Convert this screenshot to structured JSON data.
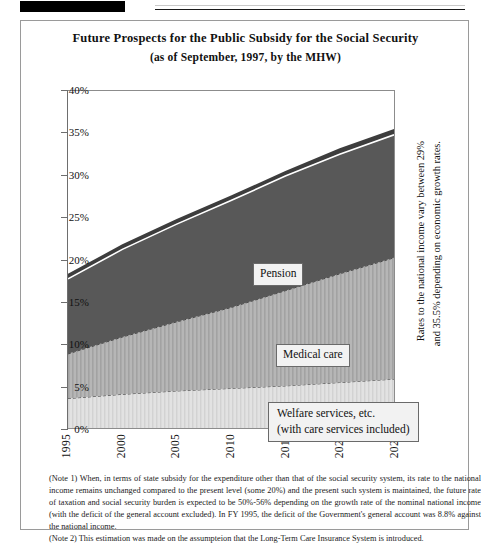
{
  "header": {
    "redaction": "",
    "rule": ""
  },
  "figure": {
    "title_line1": "Future Prospects for the Public Subsidy for the Social Security",
    "title_line2": "(as of September, 1997, by the MHW)",
    "side_caption_line1": "Rates to the national income vary between 29%",
    "side_caption_line2": "and 35.5% depending on economic growth rates.",
    "labels": {
      "pension": "Pension",
      "medical": "Medical care",
      "welfare_line1": "Welfare services, etc.",
      "welfare_line2": "(with care services included)"
    },
    "notes": {
      "note1": "(Note 1) When, in terms of state subsidy for the expenditure other than that of the social security system, its rate to the national income remains unchanged compared to the present level (some 20%) and the present such system is maintained, the future rate of taxation and social security burden is expected to be 50%-56% depending on the growth rate of the nominal national income (with the deficit of the general account excluded).  In FY 1995, the deficit of the Government's general account was 8.8% against the national income.",
      "note2": "(Note 2) This estimation was made on the assumpteion that the Long-Term Care Insurance System is introduced."
    }
  },
  "chart_data": {
    "type": "area",
    "title": "Future Prospects for the Public Subsidy for the Social Security",
    "subtitle": "(as of September, 1997, by the MHW)",
    "xlabel": "",
    "ylabel": "",
    "stacked": true,
    "grid": false,
    "legend_position": "in-plot",
    "x": [
      1995,
      2000,
      2005,
      2010,
      2015,
      2020,
      2025
    ],
    "xlim": [
      1995,
      2025
    ],
    "ylim": [
      0,
      40
    ],
    "ytick_labels": [
      "0%",
      "5%",
      "10%",
      "15%",
      "20%",
      "25%",
      "30%",
      "35%",
      "40%"
    ],
    "ytick_values": [
      0,
      5,
      10,
      15,
      20,
      25,
      30,
      35,
      40
    ],
    "xtick_labels": [
      "1995",
      "2000",
      "2005",
      "2010",
      "2015",
      "2020",
      "2025"
    ],
    "series": [
      {
        "name": "Welfare services, etc. (with care services included)",
        "color": "#dcdcdc",
        "values": [
          3.5,
          4.0,
          4.4,
          4.7,
          5.0,
          5.4,
          5.8
        ]
      },
      {
        "name": "Medical care",
        "color": "#b0b0b0",
        "values": [
          5.3,
          6.8,
          8.2,
          9.6,
          11.3,
          12.9,
          14.4
        ]
      },
      {
        "name": "Pension",
        "color": "#585858",
        "values": [
          8.9,
          10.4,
          11.6,
          12.7,
          13.6,
          14.2,
          14.6
        ]
      },
      {
        "name": "Upper band",
        "color": "#3d3d3d",
        "values": [
          0.6,
          0.6,
          0.6,
          0.6,
          0.6,
          0.7,
          0.7
        ]
      }
    ],
    "cumulative_top": [
      18.3,
      21.8,
      24.8,
      27.6,
      30.5,
      33.2,
      35.5
    ],
    "annotations": [
      {
        "text": "Rates to the national income vary between 29% and 35.5% depending on economic growth rates.",
        "position": "right-outside"
      }
    ]
  }
}
